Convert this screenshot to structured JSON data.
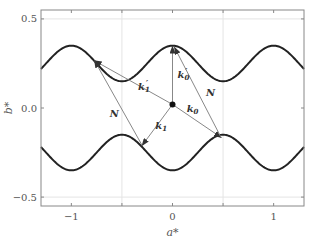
{
  "chart_data": {
    "type": "line",
    "title": "",
    "xlabel": "a*",
    "ylabel": "b*",
    "xlim": [
      -1.3,
      1.3
    ],
    "ylim": [
      -0.55,
      0.55
    ],
    "xticks": [
      -1,
      -0.5,
      0,
      0.5,
      1
    ],
    "xtick_labels": [
      "−1",
      "",
      "0",
      "",
      "1"
    ],
    "yticks": [
      -0.5,
      0.0,
      0.5
    ],
    "ytick_labels": [
      "−0.5",
      "0.0",
      "0.5"
    ],
    "grid": {
      "x": [
        -0.5,
        0.5
      ],
      "y": [
        -0.5,
        0.5
      ]
    },
    "series": [
      {
        "name": "upper-boundary",
        "function": "0.25 + 0.1*cos(2*pi*x)",
        "color": "#222222"
      },
      {
        "name": "lower-boundary",
        "function": "-0.25 - 0.1*cos(2*pi*x)",
        "color": "#222222"
      }
    ],
    "origin_point": {
      "x": 0.0,
      "y": 0.02
    },
    "vectors": [
      {
        "name": "k0-prime",
        "label": "k0'",
        "from": [
          0.0,
          0.02
        ],
        "to": [
          0.0,
          0.345
        ],
        "label_at": [
          0.05,
          0.17
        ]
      },
      {
        "name": "k0",
        "label": "k0",
        "from": [
          0.0,
          0.02
        ],
        "to": [
          0.48,
          -0.165
        ],
        "label_at": [
          0.14,
          -0.02
        ]
      },
      {
        "name": "N-right",
        "label": "N",
        "from": [
          0.48,
          -0.165
        ],
        "to": [
          0.02,
          0.34
        ],
        "label_at": [
          0.33,
          0.07
        ]
      },
      {
        "name": "k1-prime",
        "label": "k1'",
        "from": [
          0.0,
          0.02
        ],
        "to": [
          -0.77,
          0.265
        ],
        "label_at": [
          -0.34,
          0.1
        ]
      },
      {
        "name": "k1",
        "label": "k1",
        "from": [
          0.0,
          0.02
        ],
        "to": [
          -0.3,
          -0.21
        ],
        "label_at": [
          -0.17,
          -0.12
        ]
      },
      {
        "name": "N-left",
        "label": "N",
        "from": [
          -0.3,
          -0.21
        ],
        "to": [
          -0.77,
          0.265
        ],
        "label_at": [
          -0.62,
          -0.05
        ]
      }
    ],
    "colors": {
      "curve": "#222222",
      "vector": "#888888",
      "grid": "#e4e4e4",
      "axis": "#888888"
    }
  }
}
